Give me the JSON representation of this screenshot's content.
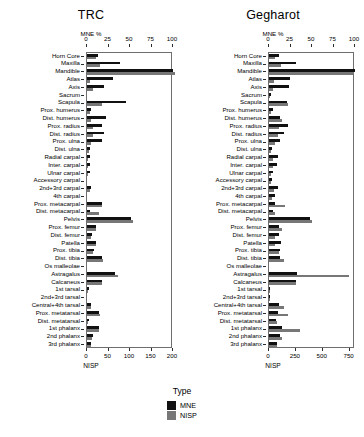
{
  "legend": {
    "title": "Type",
    "entries": [
      {
        "label": "MNE",
        "color": "#111111"
      },
      {
        "label": "NISP",
        "color": "#777777"
      }
    ]
  },
  "chart_data": [
    {
      "type": "bar",
      "title": "TRC",
      "orientation": "horizontal",
      "grid": false,
      "legend_position": "bottom",
      "top_axis": {
        "label": "MNE %",
        "ticks": [
          0,
          25,
          50,
          75,
          100
        ],
        "lim": [
          0,
          100
        ]
      },
      "bottom_axis": {
        "label": "NISP",
        "ticks": [
          0,
          50,
          100,
          150,
          200
        ],
        "lim": [
          0,
          200
        ]
      },
      "categories": [
        "Horn Core",
        "Maxilla",
        "Mandible",
        "Atlas",
        "Axis",
        "Sacrum",
        "Scapula",
        "Prox. humerus",
        "Dist. humerus",
        "Prox. radius",
        "Dist. radius",
        "Prox. ulna",
        "Dist. ulna",
        "Radial carpal",
        "Inter. carpal",
        "Ulnar carpal",
        "Accessory carpal",
        "2nd+3rd carpal",
        "4th carpal",
        "Prox. metacarpal",
        "Dist. metacarpal",
        "Pelvis",
        "Prox. femur",
        "Dist. femur",
        "Patella",
        "Prox. tibia",
        "Dist. tibia",
        "Os malleolae",
        "Astragalus",
        "Calcaneus",
        "1st tarsal",
        "2nd+3rd tarsal",
        "Central+4th tarsal",
        "Prox. metatarsal",
        "Dist. metatarsal",
        "1st phalanx",
        "2nd phalanx",
        "3rd phalanx"
      ],
      "series": [
        {
          "name": "MNE",
          "unit": "percent",
          "values": [
            13,
            38,
            100,
            30,
            20,
            0,
            45,
            5,
            22,
            18,
            20,
            17,
            4,
            3,
            3,
            3,
            0,
            5,
            0,
            17,
            3,
            51,
            11,
            6,
            10,
            8,
            18,
            0,
            33,
            17,
            2,
            0,
            5,
            14,
            2,
            14,
            7,
            5
          ]
        },
        {
          "name": "NISP",
          "unit": "count",
          "values": [
            22,
            30,
            205,
            8,
            15,
            0,
            36,
            6,
            10,
            14,
            13,
            10,
            4,
            3,
            3,
            3,
            0,
            6,
            0,
            34,
            27,
            108,
            21,
            9,
            20,
            15,
            38,
            0,
            72,
            36,
            3,
            0,
            10,
            30,
            3,
            29,
            12,
            10
          ]
        }
      ]
    },
    {
      "type": "bar",
      "title": "Gegharot",
      "orientation": "horizontal",
      "grid": false,
      "legend_position": "bottom",
      "top_axis": {
        "label": "MNE %",
        "ticks": [
          0,
          25,
          50,
          75,
          100
        ],
        "lim": [
          0,
          100
        ]
      },
      "bottom_axis": {
        "label": "NISP",
        "ticks": [
          0,
          250,
          500,
          750
        ],
        "lim": [
          0,
          800
        ]
      },
      "categories": [
        "Horn Core",
        "Maxilla",
        "Mandible",
        "Atlas",
        "Axis",
        "Sacrum",
        "Scapula",
        "Prox. humerus",
        "Dist. humerus",
        "Prox. radius",
        "Dist. radius",
        "Prox. ulna",
        "Dist. ulna",
        "Radial carpal",
        "Inter. carpal",
        "Ulnar carpal",
        "Accessory carpal",
        "2nd+3rd carpal",
        "4th carpal",
        "Prox. metacarpal",
        "Dist. metacarpal",
        "Pelvis",
        "Prox. femur",
        "Dist. femur",
        "Patella",
        "Prox. tibia",
        "Dist. tibia",
        "Os malleolae",
        "Astragalus",
        "Calcaneus",
        "1st tarsal",
        "2nd+3rd tarsal",
        "Central+4th tarsal",
        "Prox. metatarsal",
        "Dist. metatarsal",
        "1st phalanx",
        "2nd phalanx",
        "3rd phalanx"
      ],
      "series": [
        {
          "name": "MNE",
          "unit": "percent",
          "values": [
            12,
            31,
            100,
            24,
            23,
            2,
            21,
            5,
            13,
            22,
            18,
            13,
            4,
            10,
            9,
            5,
            4,
            10,
            7,
            7,
            5,
            48,
            12,
            12,
            14,
            13,
            13,
            0,
            33,
            31,
            1,
            1,
            12,
            10,
            8,
            15,
            13,
            9
          ]
        },
        {
          "name": "NISP",
          "unit": "count",
          "values": [
            60,
            115,
            795,
            45,
            40,
            6,
            175,
            22,
            120,
            95,
            80,
            55,
            18,
            40,
            38,
            20,
            16,
            42,
            30,
            150,
            60,
            400,
            120,
            60,
            55,
            95,
            135,
            0,
            745,
            255,
            5,
            4,
            140,
            175,
            70,
            285,
            120,
            75
          ]
        }
      ]
    }
  ]
}
